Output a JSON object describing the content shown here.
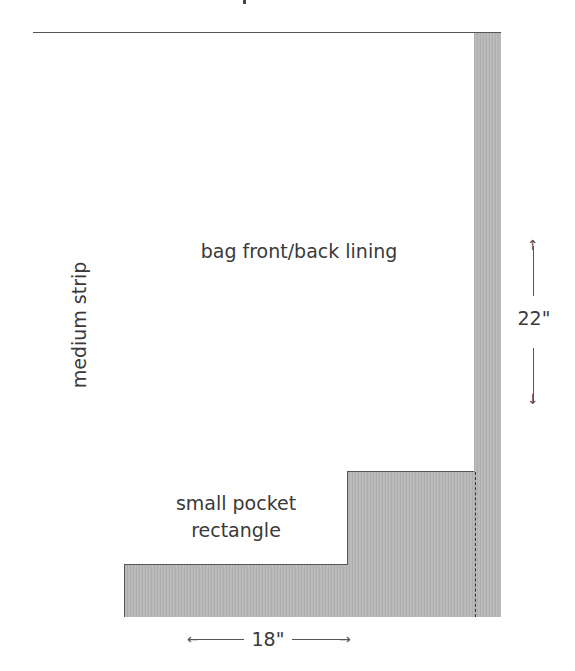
{
  "diagram": {
    "type": "cutting-layout",
    "pieces": [
      {
        "id": "medium-strip",
        "label": "medium strip",
        "orientation": "vertical-text"
      },
      {
        "id": "bag-lining",
        "label": "bag front/back lining"
      },
      {
        "id": "pocket",
        "label_line1": "small pocket",
        "label_line2": "rectangle"
      }
    ],
    "waste_color": "#b9b9b9",
    "line_color": "#555555",
    "dimensions": {
      "height": "22\"",
      "width": "18\""
    },
    "arrows": {
      "up": "↑",
      "down": "↓",
      "left": "←",
      "right": "→"
    }
  }
}
